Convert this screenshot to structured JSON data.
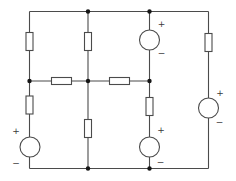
{
  "canvas": {
    "width": 236,
    "height": 181,
    "background_color": "#ffffff"
  },
  "style": {
    "wire_color": "#4b4b4b",
    "wire_width": 1.1,
    "component_stroke": "#4b4b4b",
    "component_fill": "#ffffff",
    "node_color": "#161616",
    "node_radius": 2.2,
    "label_color": "#3a3a3a",
    "label_font_size": 9
  },
  "circuit": {
    "wires": [
      {
        "name": "top-rail",
        "x1": 29.5,
        "y1": 11.5,
        "x2": 208.5,
        "y2": 11.5
      },
      {
        "name": "bottom-rail",
        "x1": 29.5,
        "y1": 168.5,
        "x2": 208.5,
        "y2": 168.5
      },
      {
        "name": "middle-rail",
        "x1": 29.5,
        "y1": 81,
        "x2": 149.5,
        "y2": 81
      },
      {
        "name": "left-branch",
        "x1": 29.5,
        "y1": 11.5,
        "x2": 29.5,
        "y2": 168.5
      },
      {
        "name": "inner-left-branch",
        "x1": 88,
        "y1": 11.5,
        "x2": 88,
        "y2": 168.5
      },
      {
        "name": "inner-right-branch",
        "x1": 149.5,
        "y1": 11.5,
        "x2": 149.5,
        "y2": 168.5
      },
      {
        "name": "right-branch",
        "x1": 208.5,
        "y1": 11.5,
        "x2": 208.5,
        "y2": 168.5
      }
    ],
    "resistors": [
      {
        "name": "resistor-left-top",
        "cx": 29.5,
        "cy": 41.5,
        "orientation": "vertical"
      },
      {
        "name": "resistor-innerleft-top",
        "cx": 88,
        "cy": 41.5,
        "orientation": "vertical"
      },
      {
        "name": "resistor-right-top",
        "cx": 208.5,
        "cy": 42.5,
        "orientation": "vertical"
      },
      {
        "name": "resistor-left-lower",
        "cx": 29.5,
        "cy": 105,
        "orientation": "vertical"
      },
      {
        "name": "resistor-innerleft-lower",
        "cx": 88,
        "cy": 128.5,
        "orientation": "vertical"
      },
      {
        "name": "resistor-innerright-lower",
        "cx": 149.5,
        "cy": 106.5,
        "orientation": "vertical"
      },
      {
        "name": "resistor-middle-left",
        "cx": 61.5,
        "cy": 81,
        "orientation": "horizontal"
      },
      {
        "name": "resistor-middle-right",
        "cx": 119.5,
        "cy": 81,
        "orientation": "horizontal"
      }
    ],
    "resistor_size": {
      "length": 18,
      "breadth": 7,
      "h_length": 20,
      "h_breadth": 7
    },
    "sources": [
      {
        "name": "source-top-center",
        "cx": 149.5,
        "cy": 40,
        "r": 10,
        "plus": {
          "text": "+",
          "x": 161.5,
          "y": 27
        },
        "minus": {
          "text": "−",
          "x": 161.5,
          "y": 56
        }
      },
      {
        "name": "source-right-edge",
        "cx": 208.5,
        "cy": 108,
        "r": 10,
        "plus": {
          "text": "+",
          "x": 220,
          "y": 95.5
        },
        "minus": {
          "text": "−",
          "x": 219.5,
          "y": 125
        }
      },
      {
        "name": "source-bottom-left",
        "cx": 30,
        "cy": 147,
        "r": 10,
        "plus": {
          "text": "+",
          "x": 16,
          "y": 133.5
        },
        "minus": {
          "text": "−",
          "x": 16,
          "y": 166
        }
      },
      {
        "name": "source-bottom-center",
        "cx": 149.5,
        "cy": 147,
        "r": 10,
        "plus": {
          "text": "+",
          "x": 161,
          "y": 133
        },
        "minus": {
          "text": "−",
          "x": 160.5,
          "y": 165
        }
      }
    ],
    "nodes": [
      {
        "x": 88,
        "y": 11.5
      },
      {
        "x": 149.5,
        "y": 11.5
      },
      {
        "x": 29.5,
        "y": 81
      },
      {
        "x": 88,
        "y": 81
      },
      {
        "x": 149.5,
        "y": 81
      },
      {
        "x": 88,
        "y": 168.5
      },
      {
        "x": 149.5,
        "y": 168.5
      }
    ]
  }
}
